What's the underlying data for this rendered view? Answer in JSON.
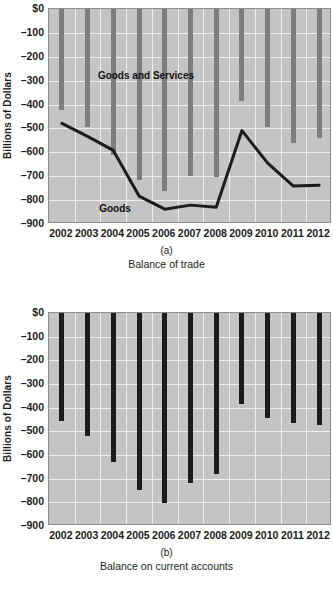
{
  "figure": {
    "ylabel": "Billions of Dollars",
    "yticks": [
      "$0",
      "–100",
      "–200",
      "–300",
      "–400",
      "–500",
      "–600",
      "–700",
      "–800",
      "–900"
    ],
    "xticks": [
      "2002",
      "2003",
      "2004",
      "2005",
      "2006",
      "2007",
      "2008",
      "2009",
      "2010",
      "2011",
      "2012"
    ],
    "panel_a_letter": "(a)",
    "panel_a_caption": "Balance of trade",
    "panel_b_letter": "(b)",
    "panel_b_caption": "Balance on current accounts"
  },
  "chart_data": [
    {
      "type": "bar",
      "panel": "a",
      "title": "Balance of trade",
      "xlabel": "",
      "ylabel": "Billions of Dollars",
      "ylim": [
        -900,
        0
      ],
      "ytick_values": [
        0,
        -100,
        -200,
        -300,
        -400,
        -500,
        -600,
        -700,
        -800,
        -900
      ],
      "grid": true,
      "legend": "inline-annotation",
      "categories": [
        "2002",
        "2003",
        "2004",
        "2005",
        "2006",
        "2007",
        "2008",
        "2009",
        "2010",
        "2011",
        "2012"
      ],
      "series": [
        {
          "name": "Goods and Services",
          "render": "bar",
          "color": "#7d7d7d",
          "annotation": "Goods and Services",
          "values": [
            -421,
            -495,
            -610,
            -714,
            -762,
            -701,
            -702,
            -384,
            -495,
            -560,
            -540
          ]
        },
        {
          "name": "Goods",
          "render": "line",
          "color": "#1c1c1c",
          "annotation": "Goods",
          "values": [
            -479,
            -533,
            -592,
            -783,
            -838,
            -821,
            -830,
            -509,
            -645,
            -741,
            -738
          ]
        }
      ]
    },
    {
      "type": "bar",
      "panel": "b",
      "title": "Balance on current accounts",
      "xlabel": "",
      "ylabel": "Billions of Dollars",
      "ylim": [
        -900,
        0
      ],
      "ytick_values": [
        0,
        -100,
        -200,
        -300,
        -400,
        -500,
        -600,
        -700,
        -800,
        -900
      ],
      "grid": true,
      "categories": [
        "2002",
        "2003",
        "2004",
        "2005",
        "2006",
        "2007",
        "2008",
        "2009",
        "2010",
        "2011",
        "2012"
      ],
      "series": [
        {
          "name": "Balance on current accounts",
          "render": "bar",
          "color": "#1c1c1c",
          "values": [
            -456,
            -518,
            -629,
            -746,
            -803,
            -718,
            -681,
            -384,
            -442,
            -466,
            -475
          ]
        }
      ]
    }
  ]
}
